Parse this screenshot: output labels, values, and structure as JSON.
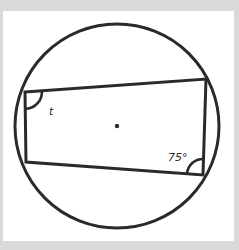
{
  "diagram": {
    "type": "cyclic-quadrilateral-in-circle",
    "colors": {
      "background_border": "#d9d9d9",
      "panel": "#ffffff",
      "stroke": "#2a2a2a"
    },
    "circle": {
      "cx": 117,
      "cy": 126,
      "r": 102,
      "center_dot": true
    },
    "quadrilateral": {
      "vertices": [
        {
          "name": "top-left",
          "x": 25,
          "y": 92
        },
        {
          "name": "top-right",
          "x": 206,
          "y": 79
        },
        {
          "name": "bottom-right",
          "x": 203,
          "y": 175
        },
        {
          "name": "bottom-left",
          "x": 26,
          "y": 162
        }
      ]
    },
    "angles": [
      {
        "vertex": "top-left",
        "label": "t"
      },
      {
        "vertex": "bottom-right",
        "label": "75°"
      }
    ]
  }
}
